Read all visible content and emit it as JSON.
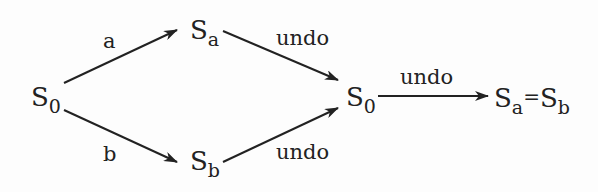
{
  "diagram": {
    "nodes": {
      "s0_start": {
        "base": "S",
        "sub": "0"
      },
      "sa": {
        "base": "S",
        "sub": "a"
      },
      "sb": {
        "base": "S",
        "sub": "b"
      },
      "s0_end": {
        "base": "S",
        "sub": "0"
      },
      "result": {
        "left_base": "S",
        "left_sub": "a",
        "eq": "=",
        "right_base": "S",
        "right_sub": "b"
      }
    },
    "edges": [
      {
        "from": "S0",
        "to": "Sa",
        "label": "a"
      },
      {
        "from": "S0",
        "to": "Sb",
        "label": "b"
      },
      {
        "from": "Sa",
        "to": "S0",
        "label": "undo"
      },
      {
        "from": "Sb",
        "to": "S0",
        "label": "undo"
      },
      {
        "from": "S0",
        "to": "Sa = Sb",
        "label": "undo"
      }
    ],
    "colors": {
      "stroke": "#222222",
      "background": "#fdfdfd"
    }
  }
}
